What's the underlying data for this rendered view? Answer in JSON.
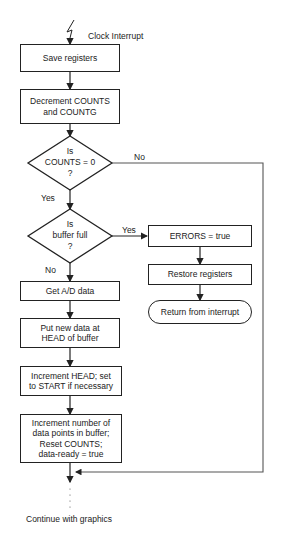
{
  "flowchart": {
    "start": {
      "label": "Clock Interrupt",
      "icon": "lightning-icon"
    },
    "steps": {
      "save": "Save registers",
      "decrement": [
        "Decrement COUNTS",
        "and COUNTG"
      ],
      "decision_counts": [
        "Is",
        "COUNTS = 0",
        "?"
      ],
      "decision_buffer": [
        "Is",
        "buffer full",
        "?"
      ],
      "get_ad": "Get A/D data",
      "put_data": [
        "Put new data at",
        "HEAD of buffer"
      ],
      "increment_head": [
        "Increment HEAD; set",
        "to START if necessary"
      ],
      "increment_points": [
        "Increment number of",
        "data points in buffer;",
        "Reset COUNTS;",
        "data-ready = true"
      ],
      "errors": "ERRORS = true",
      "restore": "Restore registers",
      "return": "Return from interrupt"
    },
    "branches": {
      "counts_no": "No",
      "counts_yes": "Yes",
      "buffer_yes": "Yes",
      "buffer_no": "No"
    },
    "end": {
      "label": "Continue with graphics"
    }
  },
  "colors": {
    "line": "#222222",
    "background": "#ffffff"
  }
}
